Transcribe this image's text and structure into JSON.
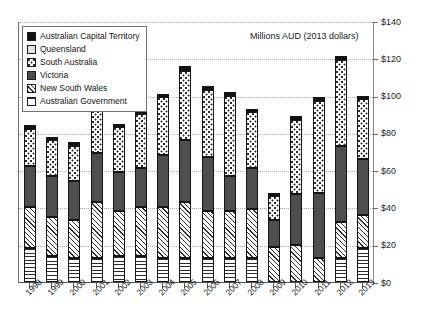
{
  "chart_data": {
    "type": "bar",
    "stacked": true,
    "title": "Millions AUD (2013 dollars)",
    "xlabel": "",
    "ylabel": "",
    "ylim": [
      0,
      140
    ],
    "ytick_step": 20,
    "ytick_labels": [
      "$0",
      "$20",
      "$40",
      "$60",
      "$80",
      "$100",
      "$120",
      "$140"
    ],
    "ytick_values": [
      0,
      20,
      40,
      60,
      80,
      100,
      120,
      140
    ],
    "grid": true,
    "grid_axis": "y",
    "legend_position": "upper-left",
    "categories": [
      "1998",
      "1999",
      "2000",
      "2001",
      "2002",
      "2003",
      "2004",
      "2005",
      "2006",
      "2007",
      "2008",
      "2009",
      "2010",
      "2011",
      "2012",
      "2013"
    ],
    "series": [
      {
        "name": "Australian Government",
        "pattern": "horizontal-lines",
        "color": "#ffffff",
        "values": [
          18,
          14,
          13,
          13,
          14,
          14,
          13,
          13,
          13,
          13,
          13,
          0,
          0,
          0,
          13,
          18
        ]
      },
      {
        "name": "New South Wales",
        "pattern": "diagonal-hatch",
        "color": "#ffffff",
        "values": [
          22,
          21,
          20,
          30,
          24,
          26,
          27,
          30,
          25,
          25,
          26,
          19,
          20,
          13,
          19,
          18
        ]
      },
      {
        "name": "Victoria",
        "pattern": "solid-dark-gray",
        "color": "#4e4e4e",
        "values": [
          22,
          22,
          21,
          26,
          21,
          21,
          28,
          33,
          29,
          19,
          22,
          14,
          27,
          35,
          41,
          30
        ]
      },
      {
        "name": "South Australia",
        "pattern": "stipple-dots",
        "color": "#ffffff",
        "values": [
          20,
          19,
          19,
          23,
          24,
          29,
          31,
          37,
          36,
          43,
          30,
          13,
          40,
          49,
          46,
          32
        ]
      },
      {
        "name": "Queensland",
        "pattern": "light-gray",
        "color": "#e2e2e2",
        "values": [
          0,
          0,
          0,
          0,
          0,
          0,
          0,
          0,
          0,
          0,
          0,
          0,
          0,
          0,
          0,
          0
        ]
      },
      {
        "name": "Australian Capital Territory",
        "pattern": "solid-black",
        "color": "#111111",
        "values": [
          2,
          2,
          2,
          2,
          2,
          2,
          2,
          3,
          2,
          2,
          2,
          2,
          2,
          2,
          2,
          2
        ]
      }
    ],
    "totals": [
      84,
      78,
      75,
      94,
      85,
      92,
      101,
      116,
      105,
      102,
      93,
      48,
      89,
      99,
      121,
      100
    ],
    "annotations": []
  },
  "legend": {
    "items": [
      {
        "label": "Australian Capital Territory",
        "swatch": "solid-black"
      },
      {
        "label": "Queensland",
        "swatch": "light-gray"
      },
      {
        "label": "South Australia",
        "swatch": "stipple-dots"
      },
      {
        "label": "Victoria",
        "swatch": "solid-dark-gray"
      },
      {
        "label": "New South Wales",
        "swatch": "diagonal-hatch"
      },
      {
        "label": "Australian Government",
        "swatch": "horizontal-lines"
      }
    ]
  }
}
